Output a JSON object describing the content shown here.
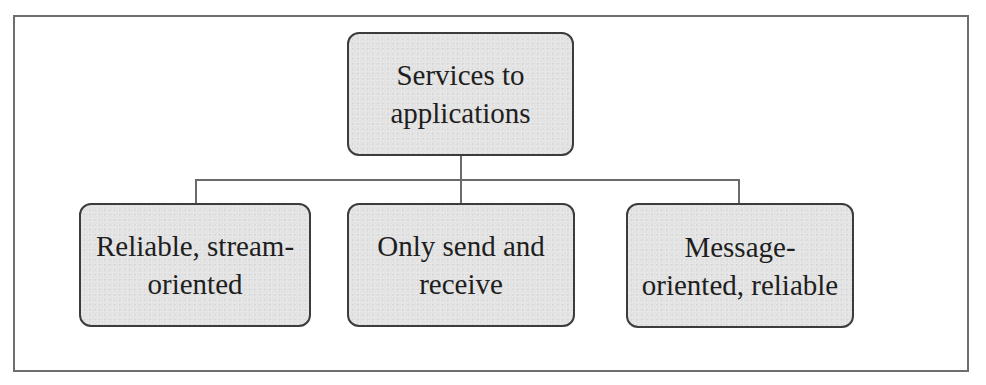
{
  "diagram": {
    "type": "hierarchy",
    "root": {
      "id": "services",
      "label": "Services to\napplications"
    },
    "children": [
      {
        "id": "reliable-stream",
        "label": "Reliable, stream-\noriented"
      },
      {
        "id": "send-receive",
        "label": "Only send and\nreceive"
      },
      {
        "id": "message-oriented",
        "label": "Message-\noriented, reliable"
      }
    ],
    "edges": [
      {
        "from": "services",
        "to": "reliable-stream"
      },
      {
        "from": "services",
        "to": "send-receive"
      },
      {
        "from": "services",
        "to": "message-oriented"
      }
    ],
    "colors": {
      "node_fill": "#e3e3e3",
      "node_border": "#3c3c3c",
      "connector": "#6a6a6a",
      "frame_border": "#6e6e6e",
      "background": "#ffffff"
    }
  }
}
